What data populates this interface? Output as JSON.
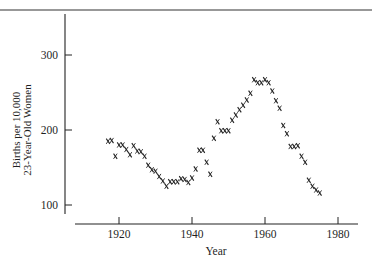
{
  "chart_data": {
    "type": "scatter",
    "title": "",
    "xlabel": "Year",
    "ylabel": [
      "Births per 10,000",
      "23-Year-Old Women"
    ],
    "xlim": [
      1909,
      1987
    ],
    "ylim": [
      85,
      360
    ],
    "xticks": [
      1920,
      1940,
      1960,
      1980
    ],
    "yticks": [
      100,
      200,
      300
    ],
    "grid": false,
    "legend": null,
    "marker": "x",
    "x": [
      1917,
      1918,
      1919,
      1920,
      1921,
      1922,
      1923,
      1924,
      1925,
      1926,
      1927,
      1928,
      1929,
      1930,
      1931,
      1932,
      1933,
      1934,
      1935,
      1936,
      1937,
      1938,
      1939,
      1940,
      1941,
      1942,
      1943,
      1944,
      1945,
      1946,
      1947,
      1948,
      1949,
      1950,
      1951,
      1952,
      1953,
      1954,
      1955,
      1956,
      1957,
      1958,
      1959,
      1960,
      1961,
      1962,
      1963,
      1964,
      1965,
      1966,
      1967,
      1968,
      1969,
      1970,
      1971,
      1972,
      1973,
      1974,
      1975
    ],
    "y": [
      185,
      186,
      165,
      180,
      180,
      174,
      167,
      179,
      172,
      171,
      165,
      153,
      147,
      145,
      138,
      132,
      125,
      131,
      131,
      131,
      135,
      134,
      130,
      136,
      148,
      173,
      173,
      157,
      141,
      189,
      211,
      199,
      199,
      199,
      213,
      220,
      227,
      233,
      240,
      249,
      267,
      263,
      263,
      267,
      263,
      252,
      239,
      229,
      206,
      195,
      178,
      178,
      179,
      165,
      157,
      133,
      125,
      120,
      116
    ]
  },
  "axes": {
    "xlabel": "Year",
    "ylabel_line1": "Births per 10,000",
    "ylabel_line2": "23-Year-Old Women",
    "xtick_labels": [
      "1920",
      "1940",
      "1960",
      "1980"
    ],
    "ytick_labels": [
      "300",
      "200",
      "100"
    ]
  },
  "colors": {
    "ink": "#1f1f1f",
    "background": "#ffffff"
  }
}
